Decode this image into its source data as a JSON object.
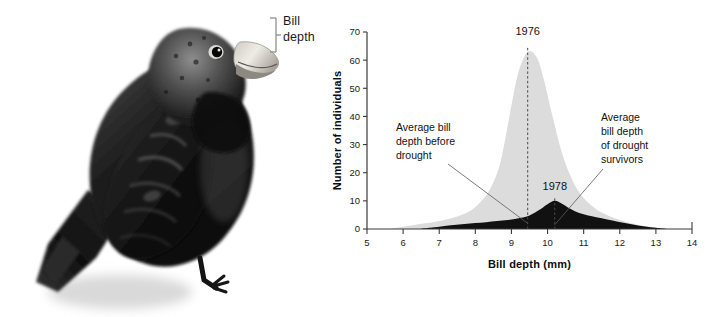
{
  "figure": {
    "photo": {
      "subject": "darwin-finch-photograph",
      "description": "Black ground finch perched, side view, with pale conical bill",
      "bracket": {
        "label_line1": "Bill",
        "label_line2": "depth",
        "color": "#8a8a8a"
      }
    }
  },
  "chart_data": {
    "type": "area",
    "title": "",
    "xlabel": "Bill depth (mm)",
    "ylabel": "Number of individuals",
    "xlim": [
      5,
      14
    ],
    "ylim": [
      0,
      70
    ],
    "xticks": [
      5,
      6,
      7,
      8,
      9,
      10,
      11,
      12,
      13,
      14
    ],
    "xtick_labels": [
      "5",
      "6",
      "7",
      "8",
      "9",
      "10",
      "11",
      "12",
      "13",
      "14"
    ],
    "yticks": [
      0,
      10,
      20,
      30,
      40,
      50,
      60,
      70
    ],
    "ytick_labels": [
      "0",
      "10",
      "20",
      "30",
      "40",
      "50",
      "60",
      "70"
    ],
    "grid": false,
    "legend": "none",
    "series": [
      {
        "name": "1976",
        "label": "1976",
        "color": "#dcdcdc",
        "mean": 9.45,
        "peak_value": 63,
        "x": [
          5.7,
          6.0,
          6.3,
          6.6,
          6.9,
          7.2,
          7.5,
          7.8,
          8.1,
          8.4,
          8.7,
          9.0,
          9.2,
          9.45,
          9.7,
          9.9,
          10.1,
          10.4,
          10.7,
          11.0,
          11.3,
          11.6,
          11.9,
          12.2,
          12.5,
          12.8,
          13.1,
          13.3
        ],
        "values": [
          0.2,
          0.8,
          1.4,
          2.0,
          2.6,
          3.4,
          4.4,
          6.0,
          9.0,
          14.0,
          24.0,
          44.0,
          56.0,
          63.0,
          61.0,
          53.0,
          42.0,
          27.0,
          17.0,
          11.0,
          7.5,
          5.2,
          3.6,
          2.4,
          1.5,
          0.9,
          0.3,
          0.0
        ]
      },
      {
        "name": "1978",
        "label": "1978",
        "color": "#111111",
        "mean": 10.2,
        "peak_value": 10,
        "x": [
          6.5,
          6.8,
          7.1,
          7.4,
          7.7,
          8.0,
          8.3,
          8.6,
          8.9,
          9.2,
          9.5,
          9.8,
          10.0,
          10.2,
          10.4,
          10.6,
          10.9,
          11.2,
          11.5,
          11.8,
          12.1,
          12.4,
          12.7,
          13.0,
          13.3
        ],
        "values": [
          0.1,
          0.5,
          1.0,
          1.4,
          1.8,
          2.1,
          2.4,
          2.8,
          3.2,
          3.8,
          4.8,
          7.0,
          8.8,
          10.0,
          9.0,
          7.4,
          5.6,
          4.6,
          3.8,
          3.0,
          2.2,
          1.5,
          0.9,
          0.4,
          0.0
        ]
      }
    ],
    "annotations": [
      {
        "id": "annotation-before-drought",
        "lines": [
          "Average bill",
          "depth before",
          "drought"
        ],
        "points_to_x": 9.45,
        "points_to_y": 2.0
      },
      {
        "id": "annotation-drought-survivors",
        "lines": [
          "Average",
          "bill depth",
          "of drought",
          "survivors"
        ],
        "points_to_x": 10.2,
        "points_to_y": 1.5
      }
    ],
    "series_labels": [
      {
        "text": "1976",
        "x": 9.45,
        "y": 69
      },
      {
        "text": "1978",
        "x": 10.2,
        "y": 14
      }
    ]
  }
}
